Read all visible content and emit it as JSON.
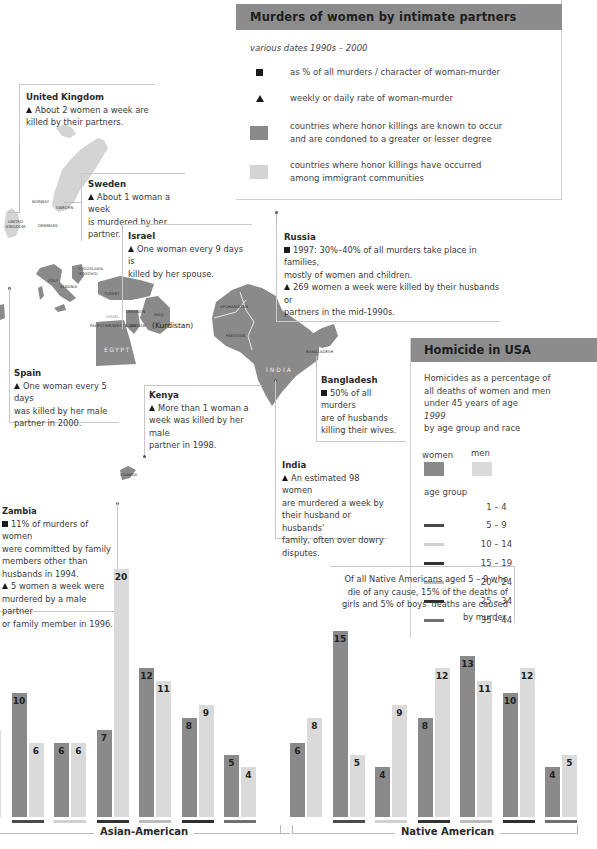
{
  "legend": {
    "title": "Murders of women by intimate partners",
    "subtitle": "various dates 1990s – 2000",
    "items": [
      {
        "symbol": "square-icon",
        "label": "as % of all murders / character of woman-murder"
      },
      {
        "symbol": "triangle-icon",
        "label": "weekly or daily rate of woman-murder"
      },
      {
        "symbol": "dark-swatch",
        "color": "#8a8a8a",
        "label_line1": "countries where honor killings are known to occur",
        "label_line2": "and are condoned to a greater or lesser degree"
      },
      {
        "symbol": "light-swatch",
        "color": "#d4d4d4",
        "label_line1": "countries where honor killings have occurred",
        "label_line2": "among immigrant communities"
      }
    ]
  },
  "callouts": {
    "uk": {
      "name": "United Kingdom",
      "line1": "About 2 women a week are",
      "line2": "killed by their partners."
    },
    "sweden": {
      "name": "Sweden",
      "line1": "About 1 woman a week",
      "line2": "is murdered by her partner."
    },
    "israel": {
      "name": "Israel",
      "line1": "One woman every 9 days is",
      "line2": "killed by her spouse."
    },
    "russia": {
      "name": "Russia",
      "line1": "1997: 30%–40% of all murders take place in families,",
      "line2": "mostly of women and children.",
      "line3": "269 women a week were killed by their husbands or",
      "line4": "partners in the mid-1990s."
    },
    "spain": {
      "name": "Spain",
      "line1": "One woman every 5 days",
      "line2": "was killed by her male",
      "line3": "partner in 2000."
    },
    "kenya": {
      "name": "Kenya",
      "line1": "More than 1 woman a",
      "line2": "week was killed by her male",
      "line3": "partner in 1998."
    },
    "bangladesh": {
      "name": "Bangladesh",
      "line1": "50% of all murders",
      "line2": "are of husbands",
      "line3": "killing their wives."
    },
    "india": {
      "name": "India",
      "line1": "An estimated 98 women",
      "line2": "are murdered a week  by",
      "line3": "their husband or husbands'",
      "line4": "family, often over dowry",
      "line5": "disputes."
    },
    "zambia": {
      "name": "Zambia",
      "line1": "11% of murders of women",
      "line2": "were committed by family",
      "line3": "members other than",
      "line4": "husbands in 1994.",
      "line5": "5 women a week were",
      "line6": "murdered by a male partner",
      "line7": "or family member in 1996."
    }
  },
  "map_labels": {
    "norway": "NORWAY",
    "sweden": "SWEDEN",
    "denmark": "DENMARK",
    "uk1": "UNITED",
    "uk2": "KINGDOM",
    "italy": "ITALY",
    "albania": "ALBANIA",
    "yugoslavia1": "YUGOSLAVIA",
    "yugoslavia2": "(KOSOVO)",
    "turkey": "TURKEY",
    "israel": "ISRAEL",
    "lebanon": "LEBANON",
    "palestine": "PALESTINE/WEST BANK",
    "jordan": "JORDAN",
    "iraq1": "IRAQ",
    "iraq2": "(Kurdistan)",
    "egypt": "EGYPT",
    "afghanistan": "AFGHANISTAN",
    "pakistan": "PAKISTAN",
    "india": "INDIA",
    "bangladesh": "BANGLADESH",
    "uganda": "UGANDA"
  },
  "usa": {
    "title": "Homicide in USA",
    "desc1": "Homicides as a percentage of",
    "desc2": "all deaths of women and men",
    "desc3": "under 45 years of age",
    "year": "1999",
    "desc4": "by age group and race",
    "women_label": "women",
    "men_label": "men",
    "age_group_label": "age group",
    "age_groups": [
      {
        "label": "1 – 4",
        "color": ""
      },
      {
        "label": "5 – 9",
        "color": "#4a4a4a"
      },
      {
        "label": "10 – 14",
        "color": "#d0d0d0"
      },
      {
        "label": "15 – 19",
        "color": "#333333"
      },
      {
        "label": "20 – 24",
        "color": "#bbbbbb"
      },
      {
        "label": "25 – 34",
        "color": "#2e2e2e"
      },
      {
        "label": "35 – 44",
        "color": "#707070"
      }
    ]
  },
  "native_note": {
    "line1": "Of all Native Americans aged 5 – 9 who",
    "line2": "die of any cause, 15% of the deaths of",
    "line3": "girls and 5% of boys' deaths are caused",
    "line4": "by murder."
  },
  "chart_data": {
    "type": "bar",
    "title": "Homicide in USA",
    "subtitle": "Homicides as a percentage of all deaths of women and men under 45 years of age, 1999, by age group and race",
    "xlabel": "age group",
    "ylabel": "% of all deaths",
    "legend": [
      "women",
      "men"
    ],
    "colors": {
      "women": "#8a8a8a",
      "men": "#dadada"
    },
    "groups": [
      {
        "name": "Asian-American",
        "categories": [
          "1 – 4",
          "5 – 9",
          "10 – 14",
          "15 – 19",
          "20 – 24",
          "25 – 34",
          "35 – 44"
        ],
        "series": [
          {
            "name": "women",
            "values": [
              4,
              10,
              6,
              7,
              12,
              8,
              5
            ]
          },
          {
            "name": "men",
            "values": [
              7,
              6,
              6,
              20,
              11,
              9,
              4
            ]
          }
        ],
        "labels_women": [
          "",
          "10",
          "6",
          "7",
          "12",
          "8",
          "5"
        ],
        "labels_men": [
          "7",
          "6",
          "6",
          "20",
          "11",
          "9",
          "4"
        ]
      },
      {
        "name": "Native American",
        "categories": [
          "1 – 4",
          "5 – 9",
          "10 – 14",
          "15 – 19",
          "20 – 24",
          "25 – 34",
          "35 – 44"
        ],
        "series": [
          {
            "name": "women",
            "values": [
              6,
              15,
              4,
              8,
              13,
              10,
              4
            ]
          },
          {
            "name": "men",
            "values": [
              8,
              5,
              9,
              12,
              11,
              12,
              5
            ]
          }
        ],
        "labels_women": [
          "6",
          "15",
          "4",
          "8",
          "13",
          "10",
          "4"
        ],
        "labels_men": [
          "8",
          "5",
          "9",
          "12",
          "11",
          "12",
          "5"
        ]
      }
    ],
    "grid": false,
    "ylim": [
      0,
      20
    ]
  }
}
